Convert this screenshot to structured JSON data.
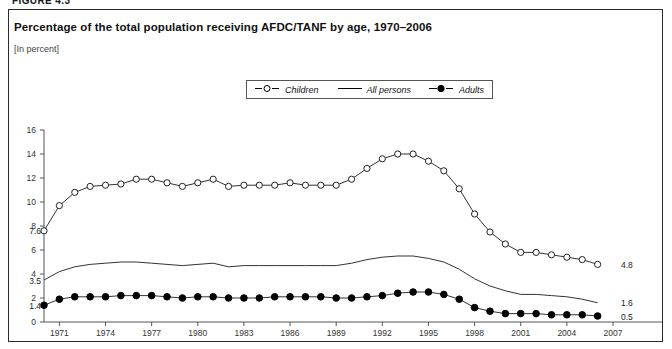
{
  "figure": {
    "label": "FIGURE 4.3"
  },
  "header": {
    "title": "Percentage of the total population receiving AFDC/TANF by age, 1970–2006",
    "subtitle": "[In percent]"
  },
  "legend": {
    "position": "top-center",
    "items": [
      {
        "label": "Children",
        "marker": "open-circle-icon",
        "color": "#000000"
      },
      {
        "label": "All persons",
        "marker": "plain-line-icon",
        "color": "#000000"
      },
      {
        "label": "Adults",
        "marker": "filled-circle-icon",
        "color": "#000000"
      }
    ]
  },
  "annotations": {
    "start": [
      {
        "series": "Children",
        "value": "7.6"
      },
      {
        "series": "All persons",
        "value": "3.5"
      },
      {
        "series": "Adults",
        "value": "1.4"
      }
    ],
    "end": [
      {
        "series": "Children",
        "value": "4.8"
      },
      {
        "series": "All persons",
        "value": "1.6"
      },
      {
        "series": "Adults",
        "value": "0.5"
      }
    ]
  },
  "chart_data": {
    "type": "line",
    "title": "Percentage of the total population receiving AFDC/TANF by age, 1970–2006",
    "subtitle": "[In percent]",
    "xlabel": "",
    "ylabel": "",
    "ylim": [
      0,
      16
    ],
    "ytick_values": [
      0,
      2,
      4,
      6,
      8,
      10,
      12,
      14,
      16
    ],
    "ytick_labels": [
      "0",
      "2",
      "4",
      "6",
      "8",
      "10",
      "12",
      "14",
      "16"
    ],
    "xlim": [
      1970,
      2007
    ],
    "xtick_values": [
      1971,
      1974,
      1977,
      1980,
      1983,
      1986,
      1989,
      1992,
      1995,
      1998,
      2001,
      2004,
      2007
    ],
    "xtick_labels": [
      "1971",
      "1974",
      "1977",
      "1980",
      "1983",
      "1986",
      "1989",
      "1992",
      "1995",
      "1998",
      "2001",
      "2004",
      "2007"
    ],
    "grid": false,
    "x": [
      1970,
      1971,
      1972,
      1973,
      1974,
      1975,
      1976,
      1977,
      1978,
      1979,
      1980,
      1981,
      1982,
      1983,
      1984,
      1985,
      1986,
      1987,
      1988,
      1989,
      1990,
      1991,
      1992,
      1993,
      1994,
      1995,
      1996,
      1997,
      1998,
      1999,
      2000,
      2001,
      2002,
      2003,
      2004,
      2005,
      2006
    ],
    "series": [
      {
        "name": "Children",
        "marker": "open-circle",
        "values": [
          7.6,
          9.7,
          10.8,
          11.3,
          11.4,
          11.5,
          11.9,
          11.9,
          11.6,
          11.3,
          11.6,
          11.9,
          11.3,
          11.4,
          11.4,
          11.4,
          11.6,
          11.4,
          11.4,
          11.4,
          11.9,
          12.8,
          13.6,
          14.0,
          14.0,
          13.4,
          12.6,
          11.1,
          9.0,
          7.5,
          6.5,
          5.8,
          5.8,
          5.6,
          5.4,
          5.2,
          4.8
        ]
      },
      {
        "name": "All persons",
        "marker": "none",
        "values": [
          3.5,
          4.2,
          4.6,
          4.8,
          4.9,
          5.0,
          5.0,
          4.9,
          4.8,
          4.7,
          4.8,
          4.9,
          4.6,
          4.7,
          4.7,
          4.7,
          4.7,
          4.7,
          4.7,
          4.7,
          4.9,
          5.2,
          5.4,
          5.5,
          5.5,
          5.3,
          5.0,
          4.4,
          3.6,
          3.0,
          2.6,
          2.3,
          2.3,
          2.2,
          2.1,
          1.9,
          1.6
        ]
      },
      {
        "name": "Adults",
        "marker": "filled-circle",
        "values": [
          1.4,
          1.9,
          2.1,
          2.1,
          2.1,
          2.2,
          2.2,
          2.2,
          2.1,
          2.0,
          2.1,
          2.1,
          2.0,
          2.0,
          2.0,
          2.1,
          2.1,
          2.1,
          2.1,
          2.0,
          2.0,
          2.1,
          2.2,
          2.4,
          2.5,
          2.5,
          2.3,
          1.9,
          1.2,
          0.9,
          0.7,
          0.7,
          0.7,
          0.6,
          0.6,
          0.6,
          0.5
        ]
      }
    ]
  }
}
